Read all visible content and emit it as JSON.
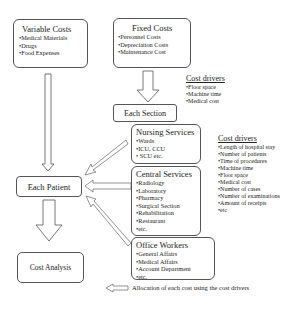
{
  "variable_costs": {
    "title": "Variable Costs",
    "items": [
      "•Medical Materials",
      "•Drugs",
      "•Food Expenses"
    ]
  },
  "fixed_costs": {
    "title": "Fixed Costs",
    "items": [
      "•Personnel Costs",
      "•Depreciation Costs",
      "•Maintenance Cost"
    ]
  },
  "cost_drivers_top": {
    "title": "Cost drivers",
    "items": [
      "•Floor space",
      "•Machine time",
      "•Medical cost"
    ]
  },
  "each_section": {
    "label": "Each Section"
  },
  "nursing_services": {
    "title": "Nursing Services",
    "items": [
      "•Wards",
      "•ICU, CCU",
      "• SCU etc."
    ]
  },
  "central_services": {
    "title": "Central Services",
    "items": [
      "•Radiology",
      "•Laboratory",
      "•Pharmacy",
      "•Surgical Section",
      "•Rehabilitation",
      "•Restaurant",
      "•etc."
    ]
  },
  "office_workers": {
    "title": "Office Workers",
    "items": [
      "•General Affairs",
      "•Medical Affairs",
      "•Account Department",
      "•etc."
    ]
  },
  "cost_drivers_right": {
    "title": "Cost drivers",
    "items": [
      "•Length of hospital stay",
      "•Number of patients",
      "•Time of procedures",
      "•Machine time",
      "•Floor space",
      "•Medical cost",
      "•Number of cases",
      "•Number of examinations",
      "•Amount of receipts",
      "•etc"
    ]
  },
  "each_patient": {
    "label": "Each Patient"
  },
  "cost_analysis": {
    "label": "Cost Analysis"
  },
  "legend": {
    "label": "Allocation of each cost  using the cost drivers"
  }
}
